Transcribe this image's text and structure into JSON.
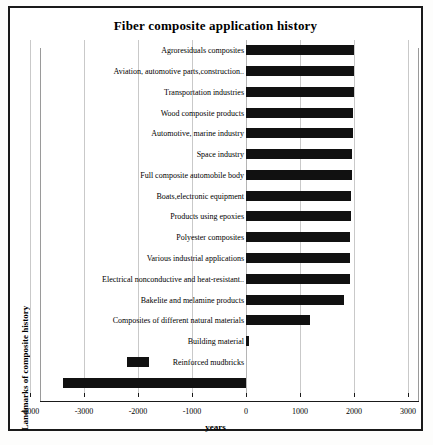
{
  "figure": {
    "title": "Fiber composite application history",
    "xlabel": "years",
    "ylabel": "Landmarks of composite history"
  },
  "axis": {
    "xticks": [
      -4000,
      -3000,
      -2000,
      -1000,
      0,
      1000,
      2000,
      3000
    ],
    "xtick_labels": [
      "-4000",
      "-3000",
      "-2000",
      "-1000",
      "0",
      "1000",
      "2000",
      "3000"
    ],
    "xlim": [
      -4000,
      3000
    ]
  },
  "colors": {
    "bar": "#111111",
    "grid": "#c9c9c9",
    "frame": "#1a1a1a",
    "background": "#ffffff"
  },
  "chart_data": {
    "type": "bar",
    "orientation": "horizontal",
    "title": "Fiber composite application history",
    "xlabel": "years",
    "ylabel": "Landmarks of composite history",
    "xlim": [
      -4000,
      3000
    ],
    "grid": true,
    "legend": "none",
    "categories": [
      "Agroresiduals composites",
      "Aviation, automotive parts,construction..",
      "Transportation industries",
      "Wood composite products",
      "Automotive, marine industry",
      "Space industry",
      "Full composite automobile  body",
      "Boats,electronic equipment",
      "Products using epoxies",
      "Polyester composites",
      "Various industrial applications",
      "Electrical nonconductive and heat-resistant..",
      "Bakelite and melamine products",
      "Composites of different natural materials",
      "Building material",
      "Reinforced mudbricks",
      "Plywood"
    ],
    "bars": [
      {
        "label": "Agroresiduals composites",
        "start": 0,
        "end": 2000
      },
      {
        "label": "Aviation, automotive parts,construction..",
        "start": 0,
        "end": 2000
      },
      {
        "label": "Transportation industries",
        "start": 0,
        "end": 1995
      },
      {
        "label": "Wood composite products",
        "start": 0,
        "end": 1990
      },
      {
        "label": "Automotive, marine industry",
        "start": 0,
        "end": 1975
      },
      {
        "label": "Space industry",
        "start": 0,
        "end": 1965
      },
      {
        "label": "Full composite automobile  body",
        "start": 0,
        "end": 1955
      },
      {
        "label": "Boats,electronic equipment",
        "start": 0,
        "end": 1950
      },
      {
        "label": "Products using epoxies",
        "start": 0,
        "end": 1940
      },
      {
        "label": "Polyester composites",
        "start": 0,
        "end": 1935
      },
      {
        "label": "Various industrial applications",
        "start": 0,
        "end": 1930
      },
      {
        "label": "Electrical nonconductive and heat-resistant..",
        "start": 0,
        "end": 1920
      },
      {
        "label": "Bakelite and melamine products",
        "start": 0,
        "end": 1820
      },
      {
        "label": "Composites of different natural materials",
        "start": 0,
        "end": 1180
      },
      {
        "label": "Building material",
        "start": 0,
        "end": 60
      },
      {
        "label": "Reinforced mudbricks",
        "start": -2200,
        "end": -1800
      },
      {
        "label": "Plywood",
        "start": -3390,
        "end": 0
      }
    ],
    "values": [
      2000,
      2000,
      1995,
      1990,
      1975,
      1965,
      1955,
      1950,
      1940,
      1935,
      1930,
      1920,
      1820,
      1180,
      60,
      -1800,
      -3390
    ]
  }
}
